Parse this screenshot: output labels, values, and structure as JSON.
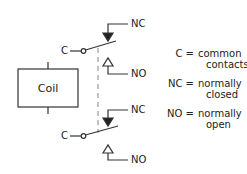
{
  "diagram": {
    "type": "relay-schematic",
    "coil": {
      "label": "Coil"
    },
    "switches": [
      {
        "common_label": "C",
        "nc_label": "NC",
        "no_label": "NO"
      },
      {
        "common_label": "C",
        "nc_label": "NC",
        "no_label": "NO"
      }
    ],
    "legend": [
      {
        "key": "C",
        "eq": "=",
        "line1": "common",
        "line2": "contacts"
      },
      {
        "key": "NC",
        "eq": "=",
        "line1": "normally",
        "line2": "closed"
      },
      {
        "key": "NO",
        "eq": "=",
        "line1": "normally",
        "line2": "open"
      }
    ],
    "colors": {
      "line": "#333333",
      "dashed": "#999999",
      "background": "#ffffff"
    }
  }
}
